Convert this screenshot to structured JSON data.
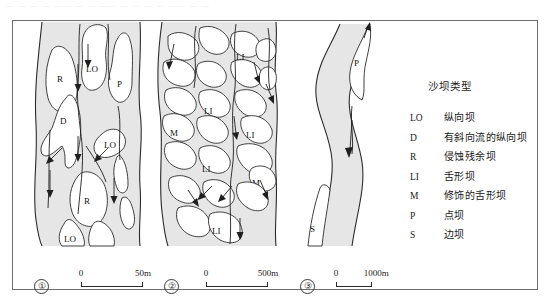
{
  "figure": {
    "top_smudge_text": "—  —   — —  ——   —  —    ——   — —    —   —   ——    —  —",
    "background_color": "#ffffff",
    "frame_color": "#6e6e6e",
    "channel_fill": "#e6e6e6",
    "bar_fill": "#ffffff",
    "ink_color": "#2b2b2b"
  },
  "legend": {
    "title": "沙坝类型",
    "entries": [
      {
        "code": "LO",
        "label": "纵向坝"
      },
      {
        "code": "D",
        "label": "有斜向流的纵向坝"
      },
      {
        "code": "R",
        "label": "侵蚀残余坝"
      },
      {
        "code": "LI",
        "label": "舌形坝"
      },
      {
        "code": "M",
        "label": "修饰的舌形坝"
      },
      {
        "code": "P",
        "label": "点坝"
      },
      {
        "code": "S",
        "label": "边坝"
      }
    ]
  },
  "panels": [
    {
      "id": "1",
      "number": "①",
      "scale": {
        "zero": "0",
        "max": "50m"
      },
      "bar_labels": [
        "R",
        "LO",
        "P",
        "D",
        "LO",
        "R",
        "LO"
      ]
    },
    {
      "id": "2",
      "number": "②",
      "scale": {
        "zero": "0",
        "max": "500m"
      },
      "bar_labels": [
        "LI",
        "LI",
        "M",
        "LI",
        "LI",
        "M",
        "LI"
      ]
    },
    {
      "id": "3",
      "number": "③",
      "scale": {
        "zero": "0",
        "max": "1000m"
      },
      "bar_labels": [
        "P",
        "S"
      ]
    }
  ]
}
